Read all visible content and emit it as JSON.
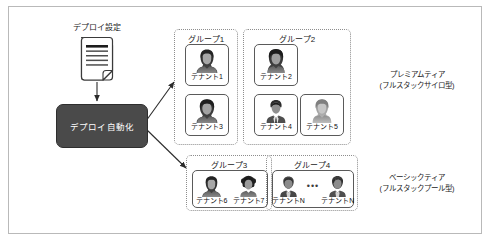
{
  "diagram": {
    "source_node": {
      "label": "デプロイ設定",
      "icon": "document-icon"
    },
    "process_node": {
      "label": "デプロイ自動化",
      "fill_color": "#4a4a4a",
      "text_color": "#ffffff"
    },
    "groups": [
      {
        "id": "group-1",
        "title": "グループ1",
        "layout": "vertical",
        "tenants": [
          {
            "label": "テナント1",
            "avatar": "avatar-female-dark-icon"
          },
          {
            "label": "テナント3",
            "avatar": "avatar-female-bob-icon"
          }
        ]
      },
      {
        "id": "group-2",
        "title": "グループ2",
        "layout": "grid",
        "tenants": [
          {
            "label": "テナント2",
            "avatar": "avatar-female-long-icon"
          },
          {
            "label": "テナント4",
            "avatar": "avatar-male-suit-icon"
          },
          {
            "label": "テナント5",
            "avatar": "avatar-person-hood-icon"
          }
        ]
      },
      {
        "id": "group-3",
        "title": "グループ3",
        "layout": "horizontal-shared",
        "tenants": [
          {
            "label": "テナント6",
            "avatar": "avatar-female-dark-icon"
          },
          {
            "label": "テナント7",
            "avatar": "avatar-female-afro-icon"
          }
        ]
      },
      {
        "id": "group-4",
        "title": "グループ4",
        "layout": "horizontal-shared-ellipsis",
        "separator": "•••",
        "tenants": [
          {
            "label": "テナントN",
            "avatar": "avatar-male-short-icon"
          },
          {
            "label": "テナントN",
            "avatar": "avatar-male-spiky-icon"
          }
        ]
      }
    ],
    "tiers": [
      {
        "id": "tier-premium",
        "name": "プレミアムティア",
        "model": "(フルスタックサイロ型)"
      },
      {
        "id": "tier-basic",
        "name": "ベーシックティア",
        "model": "(フルスタックプール型)"
      }
    ],
    "connectors": [
      {
        "from": "デプロイ設定",
        "to": "デプロイ自動化",
        "style": "straight-arrow"
      },
      {
        "from": "デプロイ自動化",
        "to": "グループ1",
        "style": "diagonal-arrow"
      },
      {
        "from": "デプロイ自動化",
        "to": "グループ3",
        "style": "diagonal-arrow"
      }
    ]
  }
}
